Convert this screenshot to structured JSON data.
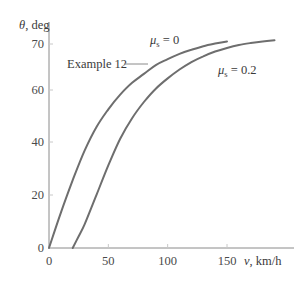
{
  "chart_data": {
    "type": "line",
    "title": "",
    "xlabel": "v, km/h",
    "xlabel_var": "v",
    "xlabel_unit": ", km/h",
    "ylabel": "θ, deg",
    "ylabel_var": "θ",
    "ylabel_unit": ", deg",
    "xlim": [
      0,
      190
    ],
    "ylim": [
      0,
      72
    ],
    "grid": false,
    "legend": "inline annotations",
    "x_ticks": [
      0,
      50,
      100,
      150
    ],
    "x_tick_labels": [
      "0",
      "50",
      "100",
      "150"
    ],
    "y_ticks": [
      0,
      20,
      40,
      60,
      70
    ],
    "y_tick_labels": [
      "0",
      "20",
      "40",
      "60",
      "70"
    ],
    "series": [
      {
        "name": "μs = 0",
        "label_var": "μ",
        "label_sub": "s",
        "label_rest": " = 0",
        "x": [
          0,
          10,
          20,
          30,
          40,
          50,
          60,
          70,
          80,
          90,
          100,
          110,
          120,
          130,
          140,
          150
        ],
        "y": [
          0,
          12,
          23,
          33,
          41,
          47,
          52,
          56,
          59,
          62,
          64,
          65.8,
          67.2,
          68.4,
          69.3,
          70
        ]
      },
      {
        "name": "μs = 0.2",
        "label_var": "μ",
        "label_sub": "s",
        "label_rest": " = 0.2",
        "x": [
          20,
          25,
          30,
          40,
          50,
          60,
          70,
          80,
          90,
          100,
          110,
          120,
          130,
          140,
          150,
          160,
          170,
          180,
          190
        ],
        "y": [
          0,
          4,
          8,
          18,
          28,
          37,
          44,
          49.5,
          54,
          57.5,
          60.5,
          63,
          65,
          66.6,
          67.8,
          68.8,
          69.5,
          70,
          70.4
        ]
      }
    ],
    "annotations": [
      {
        "text": "Example 12",
        "points_to_series": "μs = 0",
        "at_x": 82,
        "at_y": 58
      }
    ],
    "line_color": "#6e6e6e",
    "axis_color": "#8a8a8a"
  }
}
